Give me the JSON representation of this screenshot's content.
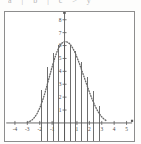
{
  "header": {
    "cut_off_text": "a | b | c > y"
  },
  "frame": {
    "border_color": "#8d8d8d",
    "background": "#ffffff"
  },
  "chart_data": {
    "type": "line",
    "title": "",
    "xlabel": "",
    "ylabel": "",
    "xlim": [
      -4.8,
      5.6
    ],
    "ylim": [
      -1.4,
      8.6
    ],
    "grid": false,
    "legend": null,
    "axis_color": "#5a5a5a",
    "curve_color": "#6a6a6a",
    "bar_color": "#555555",
    "x_ticks": [
      -4,
      -3,
      -2,
      -1,
      1,
      2,
      3,
      4,
      5
    ],
    "x_tick_labels": [
      "-4",
      "-3",
      "-2",
      "-1",
      "1",
      "2",
      "3",
      "4",
      "5"
    ],
    "y_ticks": [
      1,
      2,
      3,
      4,
      5,
      6,
      7,
      8
    ],
    "y_tick_labels": [
      "1",
      "2",
      "3",
      "4",
      "5",
      "6",
      "7",
      "8"
    ],
    "series": [
      {
        "name": "dotted-bell-curve",
        "style": "dotted",
        "x": [
          -3.0,
          -2.8,
          -2.6,
          -2.4,
          -2.2,
          -2.0,
          -1.8,
          -1.6,
          -1.4,
          -1.2,
          -1.0,
          -0.8,
          -0.6,
          -0.4,
          -0.2,
          0.0,
          0.2,
          0.4,
          0.6,
          0.8,
          1.0,
          1.2,
          1.4,
          1.6,
          1.8,
          2.0,
          2.2,
          2.4,
          2.6,
          2.8,
          3.0,
          3.2,
          3.4
        ],
        "y": [
          0.05,
          0.12,
          0.25,
          0.45,
          0.75,
          1.15,
          1.65,
          2.25,
          2.95,
          3.65,
          4.35,
          5.0,
          5.55,
          5.95,
          6.2,
          6.3,
          6.28,
          6.15,
          5.9,
          5.55,
          5.1,
          4.6,
          4.05,
          3.5,
          2.95,
          2.4,
          1.9,
          1.45,
          1.05,
          0.72,
          0.47,
          0.28,
          0.15
        ]
      },
      {
        "name": "vertical-stems",
        "style": "solid-vertical",
        "x": [
          -1.85,
          -1.35,
          -0.85,
          -0.45,
          0.0,
          0.45,
          0.85,
          1.35,
          1.85,
          2.35,
          2.85
        ],
        "y": [
          2.55,
          4.3,
          5.45,
          6.05,
          6.3,
          6.05,
          5.55,
          4.75,
          3.6,
          2.5,
          1.3
        ],
        "extends_below_axis_to": -1.4
      }
    ]
  }
}
